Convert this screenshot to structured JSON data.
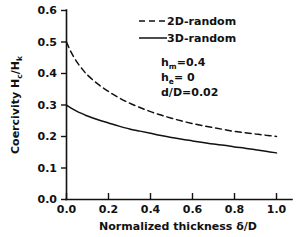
{
  "chart_data": {
    "type": "line",
    "title": "",
    "xlabel": "Normalized thickness δ/D",
    "ylabel": "Coercivity H_c/H_k",
    "ylabel_parts": {
      "word": "Coercivity",
      "numerator": "H",
      "numerator_sub": "c",
      "denominator": "H",
      "denominator_sub": "k",
      "slash": "/"
    },
    "xlabel_parts": {
      "word1": "Normalized",
      "word2": "thickness",
      "symbol": "δ/D"
    },
    "xlim": [
      0.0,
      1.0
    ],
    "ylim": [
      0.0,
      0.6
    ],
    "xticks": [
      "0.0",
      "0.2",
      "0.4",
      "0.6",
      "0.8",
      "1.0"
    ],
    "xtick_values": [
      0.0,
      0.2,
      0.4,
      0.6,
      0.8,
      1.0
    ],
    "yticks": [
      "0.0",
      "0.1",
      "0.2",
      "0.3",
      "0.4",
      "0.5",
      "0.6"
    ],
    "ytick_values": [
      0.0,
      0.1,
      0.2,
      0.3,
      0.4,
      0.5,
      0.6
    ],
    "grid": false,
    "legend_position": "upper-right",
    "x": [
      0.0,
      0.02,
      0.05,
      0.08,
      0.1,
      0.15,
      0.2,
      0.25,
      0.3,
      0.35,
      0.4,
      0.45,
      0.5,
      0.55,
      0.6,
      0.65,
      0.7,
      0.75,
      0.8,
      0.85,
      0.9,
      0.95,
      1.0
    ],
    "series": [
      {
        "name": "2D-random",
        "style": "dashed",
        "color": "#111111",
        "values": [
          0.5,
          0.47,
          0.436,
          0.41,
          0.395,
          0.366,
          0.343,
          0.323,
          0.306,
          0.292,
          0.279,
          0.268,
          0.258,
          0.249,
          0.241,
          0.234,
          0.228,
          0.222,
          0.216,
          0.212,
          0.208,
          0.204,
          0.2
        ]
      },
      {
        "name": "3D-random",
        "style": "solid",
        "color": "#111111",
        "values": [
          0.3,
          0.291,
          0.28,
          0.271,
          0.265,
          0.253,
          0.243,
          0.233,
          0.224,
          0.217,
          0.21,
          0.203,
          0.197,
          0.191,
          0.186,
          0.181,
          0.176,
          0.172,
          0.167,
          0.163,
          0.158,
          0.153,
          0.148
        ]
      }
    ],
    "annotations": [
      {
        "id": "h-m",
        "base": "h",
        "sub": "m",
        "rest": "=0.4",
        "text": "hₘ=0.4"
      },
      {
        "id": "h-e",
        "base": "h",
        "sub": "e",
        "rest": "= 0",
        "text": "hₑ= 0"
      },
      {
        "id": "d-over-D",
        "base": "d/D",
        "sub": "",
        "rest": "=0.02",
        "text": "d/D=0.02"
      }
    ]
  }
}
